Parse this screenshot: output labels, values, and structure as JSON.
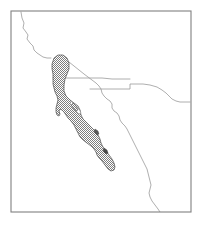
{
  "figure": {
    "kind": "locator-map",
    "title": "",
    "caption": "",
    "background_color": "#ffffff",
    "width": 202,
    "height": 225
  },
  "frame": {
    "name": "map-border",
    "x": 11,
    "y": 11,
    "width": 180,
    "height": 201,
    "stroke_color": "#808080",
    "stroke_width": 1.1,
    "fill": "none"
  },
  "styles": {
    "coastline_color": "#9a9a9a",
    "border_color": "#9a9a9a",
    "line_width": 0.8,
    "highlight_fill_color": "#8c8c8c",
    "highlight_pattern": "halftone-checker-50",
    "highlight_outline_color": "#4d4d4d",
    "highlight_outline_width": 0.7,
    "pattern_cell_px": 2
  },
  "features": {
    "highlight_region": {
      "name": "baja-california-peninsula",
      "label": "",
      "outline_points": "54,58 58,55 63,55 67,58 69,63 69,69 67,74 65,79 64,85 64,91 66,96 70,100 74,103 78,106 80,110 81,115 83,119 87,123 91,127 95,131 98,135 100,139 101,143 103,147 106,151 109,155 112,159 114,163 115,167 114,170 111,171 108,169 105,165 102,161 99,158 97,155 96,152 94,149 91,146 87,143 83,140 80,137 78,133 76,129 74,125 71,121 68,118 66,115 64,112 62,110 60,109 59,111 60,114 59,116 57,115 56,112 56,108 57,104 58,100 57,96 55,92 54,88 53,84 53,79 53,74 52,69 52,64"
    },
    "peninsula_inner_notch": {
      "name": "bahia-concepcion-inlet",
      "outline_points": "71,101 75,105 79,109 81,113 79,114 76,111 73,107 70,104"
    },
    "pacific_coastline": {
      "name": "pacific-coastline-north",
      "points": "21,12 22,18 24,23 23,28 26,32 28,35 27,39 30,43 33,46 34,50 37,53 40,55 43,57 47,58 51,58"
    },
    "gulf_mainland_coastline": {
      "name": "mainland-gulf-coastline",
      "points": "69,62 74,66 79,70 84,74 88,77 92,80 96,83 99,86 101,89 102,93 104,96 107,99 110,101 112,104 112,108 114,111 117,113 119,116 120,120 122,123 125,126 127,129 129,133 131,137 133,141 135,145 137,149 139,153 141,157 143,161 145,165 147,169 148,173 149,177 150,181 151,185 150,189 149,193 150,197 152,201 155,205 158,209 160,212"
    },
    "state_border_horizontal": {
      "name": "state-border-baja-norte-sur",
      "points": "53,78 62,78 72,78 82,78 92,78 102,78 112,79 122,79 130,79"
    },
    "state_border_sonora": {
      "name": "state-border-step",
      "points": "90,89 100,89 110,89 120,89 130,89 130,84 136,84 143,84 150,85 157,87 162,90 166,93 169,96 172,99 176,101 180,102 185,102 190,102"
    },
    "state_border_east": {
      "name": "state-border-east-segment",
      "points": "166,93 170,97 174,100 178,101 183,102 188,102 191,102"
    },
    "inner_island_a": {
      "name": "island-angel-de-la-guarda",
      "outline_points": "73,103 76,106 78,110 76,111 73,108 71,105"
    },
    "inner_island_b": {
      "name": "island-small-gulf",
      "outline_points": "95,129 98,131 99,134 97,135 95,133 94,131"
    },
    "inner_island_c": {
      "name": "island-espiritu-santo",
      "outline_points": "104,148 107,150 108,153 106,154 104,152 103,150"
    }
  },
  "annotations": {
    "visible_text_labels": []
  }
}
